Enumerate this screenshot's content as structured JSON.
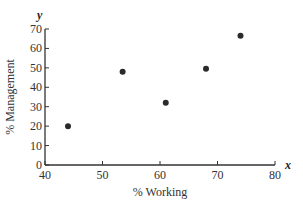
{
  "chart_data": {
    "type": "scatter",
    "title": "",
    "xlabel": "% Working",
    "ylabel": "% Management",
    "x_axis_var": "x",
    "y_axis_var": "y",
    "xlim": [
      40,
      80
    ],
    "ylim": [
      0,
      70
    ],
    "x_ticks": [
      40,
      50,
      60,
      70,
      80
    ],
    "y_ticks": [
      0,
      10,
      20,
      30,
      40,
      50,
      60,
      70
    ],
    "grid": false,
    "legend": null,
    "points": [
      {
        "x": 44,
        "y": 20
      },
      {
        "x": 53.5,
        "y": 48
      },
      {
        "x": 61,
        "y": 32
      },
      {
        "x": 68,
        "y": 49.5
      },
      {
        "x": 74,
        "y": 66.5
      }
    ]
  }
}
